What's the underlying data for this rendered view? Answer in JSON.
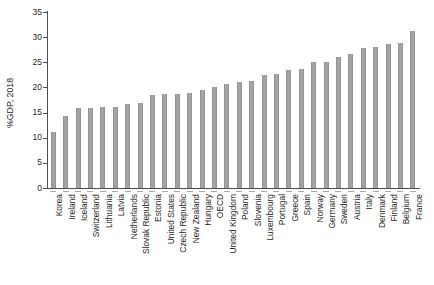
{
  "chart_data": {
    "type": "bar",
    "title": "",
    "xlabel": "",
    "ylabel": "%GDP, 2018",
    "ylim": [
      0,
      35
    ],
    "yticks": [
      0,
      5,
      10,
      15,
      20,
      25,
      30,
      35
    ],
    "grid": false,
    "legend": "none",
    "categories": [
      "Korea",
      "Ireland",
      "Iceland",
      "Switzerland",
      "Lithuania",
      "Latvia",
      "Netherlands",
      "Slovak Republic",
      "Estonia",
      "United States",
      "Czech Republic",
      "New Zealand",
      "Hungary",
      "OECD",
      "United Kingdom",
      "Poland",
      "Slovenia",
      "Luxembourg",
      "Portugal",
      "Greece",
      "Spain",
      "Norway",
      "Germany",
      "Sweden",
      "Austria",
      "Italy",
      "Denmark",
      "Finland",
      "Belgium",
      "France"
    ],
    "values": [
      11.1,
      14.4,
      16.0,
      16.0,
      16.2,
      16.2,
      16.7,
      17.0,
      18.4,
      18.7,
      18.7,
      18.9,
      19.4,
      20.1,
      20.6,
      21.1,
      21.2,
      22.4,
      22.6,
      23.5,
      23.7,
      25.0,
      25.1,
      26.1,
      26.6,
      27.9,
      28.0,
      28.7,
      28.9,
      31.2
    ],
    "colors": {
      "bar_fill": "#a6a6a6",
      "bar_edge": "#8d8d8d",
      "axis": "#4d4d4d",
      "text": "#262626",
      "background": "#ffffff"
    }
  }
}
